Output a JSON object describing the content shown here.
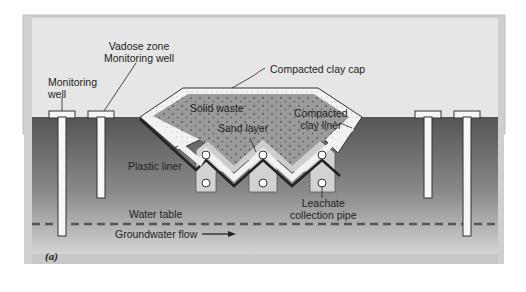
{
  "figure": {
    "panel_tag": "(a)",
    "colors": {
      "sky": "#e4e4e4",
      "frame": "#c8c8c8",
      "ground_top": "#585858",
      "ground_bottom": "#d0d0d0",
      "waste": "#9a9a9a",
      "clay": "#f2f2f2",
      "plastic_liner": "#333333",
      "sand": "#cfcfcf",
      "well": "#f7f7f7",
      "water_table_dash": "#555555"
    },
    "labels": {
      "monitoring_well": [
        "Monitoring",
        "well"
      ],
      "vadose_well": [
        "Vadose zone",
        "Monitoring well"
      ],
      "clay_cap": "Compacted clay cap",
      "solid_waste": "Solid waste",
      "sand_layer": "Sand layer",
      "clay_liner": [
        "Compacted",
        "clay liner"
      ],
      "plastic_liner": "Plastic liner",
      "leachate_pipe": [
        "Leachate",
        "collection pipe"
      ],
      "water_table": "Water table",
      "groundwater_flow": "Groundwater flow"
    },
    "wells": [
      {
        "name": "monitoring-well-left",
        "x": 62,
        "depth_bottom": 236
      },
      {
        "name": "vadose-well-left",
        "x": 101,
        "depth_bottom": 198
      },
      {
        "name": "vadose-well-right",
        "x": 427,
        "depth_bottom": 198
      },
      {
        "name": "monitoring-well-right",
        "x": 466,
        "depth_bottom": 236
      }
    ],
    "leachate_pipes": [
      {
        "x": 206,
        "y": 155
      },
      {
        "x": 263,
        "y": 155
      },
      {
        "x": 322,
        "y": 155
      },
      {
        "x": 206,
        "y": 183
      },
      {
        "x": 263,
        "y": 183
      },
      {
        "x": 322,
        "y": 183
      }
    ]
  }
}
